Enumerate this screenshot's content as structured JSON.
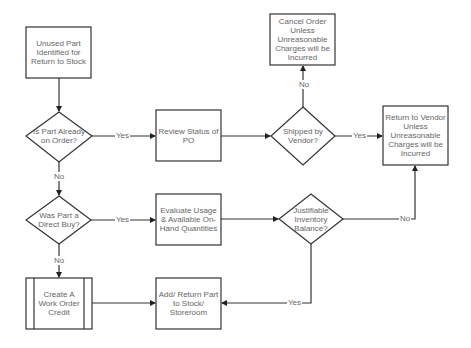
{
  "diagram": {
    "type": "flowchart",
    "colors": {
      "stroke": "#333333",
      "text": "#666666",
      "background": "#ffffff"
    },
    "nodes": [
      {
        "id": "start",
        "shape": "process",
        "label": "Unused Part Identified for Return to Stock"
      },
      {
        "id": "on_order",
        "shape": "decision",
        "label": "Is Part Already on Order?"
      },
      {
        "id": "review_po",
        "shape": "process",
        "label": "Review Status of PO"
      },
      {
        "id": "shipped",
        "shape": "decision",
        "label": "Shipped by Vendor?"
      },
      {
        "id": "cancel",
        "shape": "process",
        "label": "Cancel Order Unless Unreasonable Charges will be Incurred"
      },
      {
        "id": "return_vendor",
        "shape": "process",
        "label": "Return to Vendor Unless Unreasonable Charges will be Incurred"
      },
      {
        "id": "direct_buy",
        "shape": "decision",
        "label": "Was Part a Direct Buy?"
      },
      {
        "id": "evaluate",
        "shape": "process",
        "label": "Evaluate Usage & Available On-Hand Quantities"
      },
      {
        "id": "justifiable",
        "shape": "decision",
        "label": "Justifiable Inventory Balance?"
      },
      {
        "id": "wo_credit",
        "shape": "predefined-process",
        "label": "Create A Work Order Credit"
      },
      {
        "id": "add_return",
        "shape": "process",
        "label": "Add/ Return Part to Stock/ Storeroom"
      }
    ],
    "edges": [
      {
        "from": "start",
        "to": "on_order",
        "label": ""
      },
      {
        "from": "on_order",
        "to": "review_po",
        "label": "Yes"
      },
      {
        "from": "on_order",
        "to": "direct_buy",
        "label": "No"
      },
      {
        "from": "review_po",
        "to": "shipped",
        "label": ""
      },
      {
        "from": "shipped",
        "to": "cancel",
        "label": "No"
      },
      {
        "from": "shipped",
        "to": "return_vendor",
        "label": "Yes"
      },
      {
        "from": "direct_buy",
        "to": "evaluate",
        "label": "Yes"
      },
      {
        "from": "direct_buy",
        "to": "wo_credit",
        "label": "No"
      },
      {
        "from": "evaluate",
        "to": "justifiable",
        "label": ""
      },
      {
        "from": "justifiable",
        "to": "return_vendor",
        "label": "No"
      },
      {
        "from": "justifiable",
        "to": "add_return",
        "label": "Yes"
      },
      {
        "from": "wo_credit",
        "to": "add_return",
        "label": ""
      }
    ]
  },
  "labels": {
    "start": "Unused Part Identified for Return to Stock",
    "on_order": "Is Part Already on Order?",
    "review_po": "Review Status of PO",
    "shipped": "Shipped by Vendor?",
    "cancel": "Cancel Order Unless Unreasonable Charges will be Incurred",
    "return_vendor": "Return to Vendor Unless Unreasonable Charges will be Incurred",
    "direct_buy": "Was Part a Direct Buy?",
    "evaluate": "Evaluate Usage & Available On-Hand Quantities",
    "justifiable": "Justifiable Inventory Balance?",
    "wo_credit": "Create A Work Order Credit",
    "add_return": "Add/ Return Part to Stock/ Storeroom",
    "yes": "Yes",
    "no": "No"
  }
}
